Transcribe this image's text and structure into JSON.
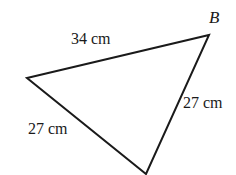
{
  "figure": {
    "type": "triangle-diagram",
    "background_color": "#ffffff",
    "stroke_color": "#1a1a1a",
    "stroke_width": 2,
    "vertices": [
      {
        "name": "left-vertex",
        "label": "",
        "x": 27,
        "y": 78
      },
      {
        "name": "top-right-vertex",
        "label": "B",
        "x": 209,
        "y": 35
      },
      {
        "name": "bottom-vertex",
        "label": "",
        "x": 146,
        "y": 174
      }
    ],
    "vertex_labels": {
      "b": "B"
    },
    "side_labels": {
      "top": "34 cm",
      "right": "27 cm",
      "left": "27 cm"
    },
    "measurements": [
      {
        "side": "top",
        "value": 34,
        "unit": "cm",
        "text": "34 cm"
      },
      {
        "side": "right",
        "value": 27,
        "unit": "cm",
        "text": "27 cm"
      },
      {
        "side": "left",
        "value": 27,
        "unit": "cm",
        "text": "27 cm"
      }
    ]
  }
}
